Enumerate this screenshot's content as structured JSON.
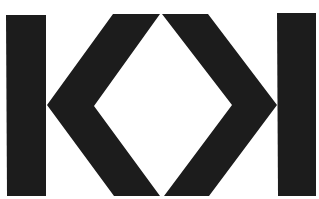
{
  "image": {
    "description": "Black geometric logo: two vertical bars flanking two opposing chevrons forming a diamond-shaped negative space",
    "colors": {
      "foreground": "#1c1c1c",
      "background": "#ffffff"
    },
    "shapes": [
      {
        "name": "left-bar"
      },
      {
        "name": "left-chevron"
      },
      {
        "name": "right-chevron"
      },
      {
        "name": "right-bar"
      }
    ]
  }
}
